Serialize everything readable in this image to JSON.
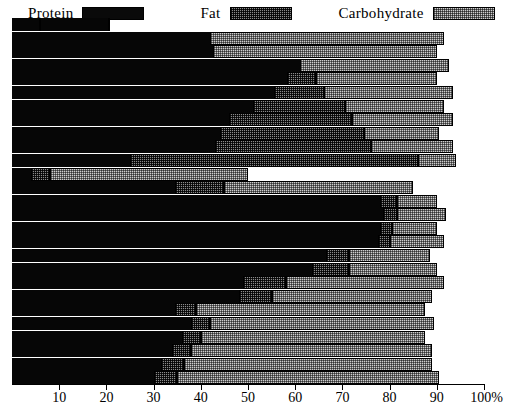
{
  "legend": {
    "items": [
      {
        "label": "Protein",
        "key": "protein",
        "swatch": "solid-black-swatch",
        "color": "#060606"
      },
      {
        "label": "Fat",
        "key": "fat",
        "swatch": "dark-stipple-swatch",
        "color": "#8a8a8a"
      },
      {
        "label": "Carbohydrate",
        "key": "carbohydrate",
        "swatch": "light-stipple-swatch",
        "color": "#cdcdcd"
      }
    ]
  },
  "axis": {
    "unit_suffix": "%",
    "ticks": [
      {
        "value": 10,
        "label": "10"
      },
      {
        "value": 20,
        "label": "20"
      },
      {
        "value": 30,
        "label": "30"
      },
      {
        "value": 40,
        "label": "40"
      },
      {
        "value": 50,
        "label": "50"
      },
      {
        "value": 60,
        "label": "60"
      },
      {
        "value": 70,
        "label": "70"
      },
      {
        "value": 80,
        "label": "80"
      },
      {
        "value": 90,
        "label": "90"
      },
      {
        "value": 100,
        "label": "100%"
      }
    ]
  },
  "chart_data": {
    "type": "bar",
    "orientation": "horizontal",
    "stacked": true,
    "title": "",
    "xlabel": "",
    "ylabel": "",
    "xlim": [
      0,
      100
    ],
    "grid": false,
    "legend_position": "top",
    "series": [
      {
        "name": "Protein",
        "key": "protein",
        "color": "#060606",
        "values": [
          20.3,
          82.0,
          81.4,
          62.5,
          58.3,
          55.5,
          51.0,
          46.0,
          44.0,
          43.0,
          25.0,
          4.0,
          34.5,
          78.0,
          78.5,
          78.0,
          77.5,
          66.5,
          63.5,
          49.0,
          48.0,
          34.5,
          38.0,
          36.0,
          34.0,
          31.5,
          30.0
        ]
      },
      {
        "name": "Fat",
        "key": "fat",
        "color": "#8a8a8a",
        "values": [
          5.7,
          42.0,
          42.5,
          61.0,
          64.5,
          66.0,
          70.5,
          72.0,
          74.5,
          76.0,
          86.0,
          8.0,
          45.0,
          81.5,
          81.5,
          80.5,
          80.0,
          71.5,
          71.5,
          58.0,
          55.0,
          39.0,
          42.0,
          40.0,
          38.0,
          36.5,
          35.0
        ]
      },
      {
        "name": "Carbohydrate",
        "key": "carbohydrate",
        "color": "#cdcdcd",
        "values": [
          5.7,
          91.5,
          90.0,
          92.5,
          90.0,
          93.5,
          91.5,
          93.5,
          90.5,
          93.5,
          94.0,
          50.0,
          85.0,
          90.0,
          92.0,
          90.0,
          91.5,
          88.5,
          90.0,
          91.5,
          89.0,
          87.5,
          89.5,
          87.5,
          89.0,
          89.0,
          90.5
        ]
      }
    ],
    "note": "values are cumulative stacked upper edges in percent"
  }
}
